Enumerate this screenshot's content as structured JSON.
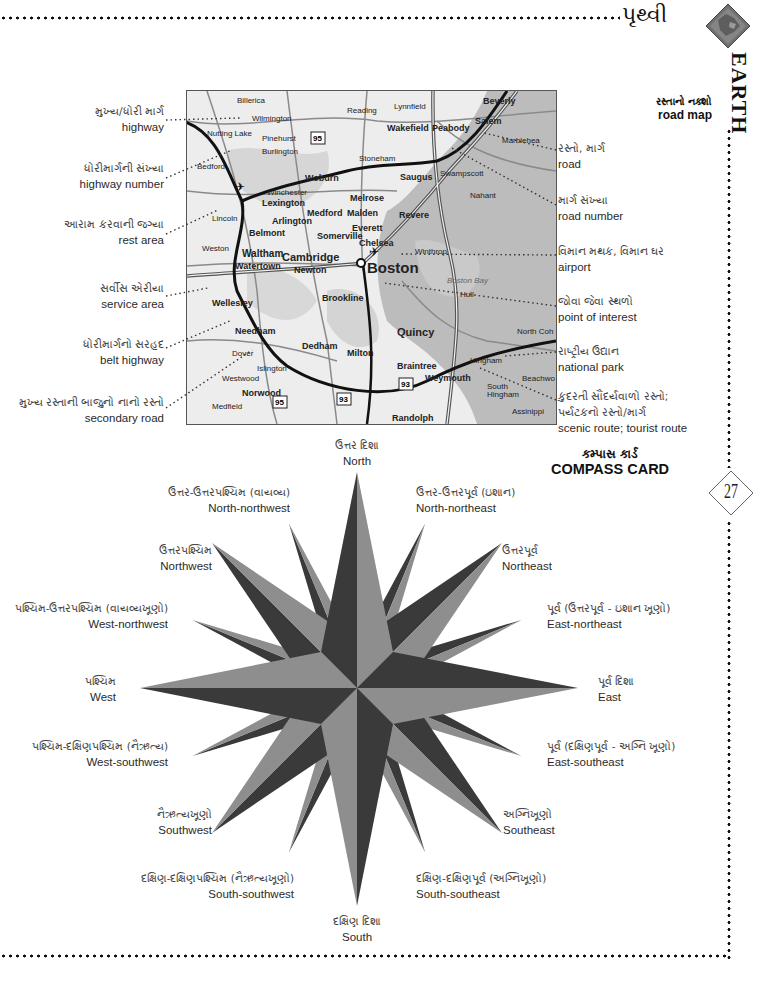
{
  "header": {
    "title_gujarati": "પૃથ્વી",
    "section_vertical": "EARTH",
    "page_number": "27"
  },
  "road_map": {
    "heading_gujarati": "રસ્તાનો નક્શો",
    "heading_english": "road map",
    "left_labels": [
      {
        "gujarati": "મુખ્ય/ધોરી માર્ગ",
        "english": "highway"
      },
      {
        "gujarati": "ધોરીમાર્ગની સંખ્યા",
        "english": "highway number"
      },
      {
        "gujarati": "આરામ કરવાની જગ્યા",
        "english": "rest area"
      },
      {
        "gujarati": "સર્વીસ એરીયા",
        "english": "service area"
      },
      {
        "gujarati": "ધોરીમાર્ગનો સરહદ",
        "english": "belt highway"
      },
      {
        "gujarati": "મુખ્ય રસ્તાની બાજુનો નાનો રસ્તો",
        "english": "secondary road"
      }
    ],
    "right_labels": [
      {
        "gujarati": "રસ્તો, માર્ગ",
        "english": "road"
      },
      {
        "gujarati": "માર્ગ સંખ્યા",
        "english": "road number"
      },
      {
        "gujarati": "વિમાન મથક, વિમાન ઘર",
        "english": "airport"
      },
      {
        "gujarati": "જોવા જેવા સ્થળો",
        "english": "point of interest"
      },
      {
        "gujarati": "રાષ્ટ્રીય ઉદ્યાન",
        "english": "national park"
      },
      {
        "gujarati": "કુદરતી સૌંદર્યવાળો રસ્તો; પર્યટકનો રસ્તો/માર્ગ",
        "english": "scenic route; tourist route"
      }
    ],
    "places": [
      "Billerica",
      "Wilmington",
      "Burlington",
      "Pinehurst",
      "Bedford",
      "Lexington",
      "Woburn",
      "Winchester",
      "Arlington",
      "Medford",
      "Lincoln",
      "Belmont",
      "Waltham",
      "Cambridge",
      "Somerville",
      "Weston",
      "Watertown",
      "Newton",
      "Boston",
      "Brookline",
      "Wellesley",
      "Needham",
      "Dover",
      "Dedham",
      "Milton",
      "Quincy",
      "Westwood",
      "Islington",
      "Norwood",
      "Medfield",
      "Randolph",
      "Braintree",
      "Weymouth",
      "Hingham",
      "South Hingham",
      "Assinippi",
      "Hull",
      "North Cohasset",
      "Beechwood",
      "Winthrop",
      "Chelsea",
      "Revere",
      "Everett",
      "Malden",
      "Melrose",
      "Saugus",
      "Stoneham",
      "Reading",
      "Lynnfield",
      "Wakefield",
      "Peabody",
      "Beverly",
      "Salem",
      "Marblehead",
      "Swampscott",
      "Nahant",
      "Boston Bay"
    ],
    "highway_numbers": [
      "95",
      "93",
      "3",
      "128",
      "1",
      "2",
      "28",
      "38",
      "60",
      "16",
      "114",
      "107",
      "129",
      "1A",
      "145",
      "203",
      "37",
      "53",
      "228",
      "109",
      "135",
      "117",
      "30",
      "20",
      "62",
      "225",
      "4",
      "24",
      "14"
    ]
  },
  "compass_card": {
    "heading_gujarati": "કમ્પાસ કાર્ડ",
    "heading_english": "COMPASS CARD",
    "directions": [
      {
        "key": "N",
        "gujarati": "ઉત્તર દિશા",
        "english": "North"
      },
      {
        "key": "NNW",
        "gujarati": "ઉત્તર-ઉત્તરપશ્ચિમ (વાયવ્ય)",
        "english": "North-northwest"
      },
      {
        "key": "NNE",
        "gujarati": "ઉત્તર-ઉત્તરપૂર્વ (ઇશાન)",
        "english": "North-northeast"
      },
      {
        "key": "NW",
        "gujarati": "ઉત્તરપશ્ચિમ",
        "english": "Northwest"
      },
      {
        "key": "NE",
        "gujarati": "ઉત્તરપૂર્વ",
        "english": "Northeast"
      },
      {
        "key": "WNW",
        "gujarati": "પશ્ચિમ-ઉત્તરપશ્ચિમ (વાયવ્યખૂણો)",
        "english": "West-northwest"
      },
      {
        "key": "ENE",
        "gujarati": "પૂર્વ (ઉત્તરપૂર્વ - ઇશાન ખૂણો)",
        "english": "East-northeast"
      },
      {
        "key": "W",
        "gujarati": "પશ્ચિમ",
        "english": "West"
      },
      {
        "key": "E",
        "gujarati": "પૂર્વ દિશા",
        "english": "East"
      },
      {
        "key": "WSW",
        "gujarati": "પશ્ચિમ-દક્ષિણપશ્ચિમ (નૈઋત્ય)",
        "english": "West-southwest"
      },
      {
        "key": "ESE",
        "gujarati": "પૂર્વ (દક્ષિણપૂર્વ - અગ્નિ ખૂણો)",
        "english": "East-southeast"
      },
      {
        "key": "SW",
        "gujarati": "નૈઋત્યખૂણો",
        "english": "Southwest"
      },
      {
        "key": "SE",
        "gujarati": "અગ્નિખૂણો",
        "english": "Southeast"
      },
      {
        "key": "SSW",
        "gujarati": "દક્ષિણ-દક્ષિણપશ્ચિમ (નૈઋત્યખૂણો)",
        "english": "South-southwest"
      },
      {
        "key": "SSE",
        "gujarati": "દક્ષિણ-દક્ષિણપૂર્વ (અગ્નિખૂણો)",
        "english": "South-southeast"
      },
      {
        "key": "S",
        "gujarati": "દક્ષિણ દિશા",
        "english": "South"
      }
    ]
  },
  "colors": {
    "dark_facet": "#3a3a3a",
    "light_facet": "#8e8e8e",
    "map_land": "#ececec",
    "map_water": "#bdbdbd",
    "map_park": "#cfcfcf"
  }
}
